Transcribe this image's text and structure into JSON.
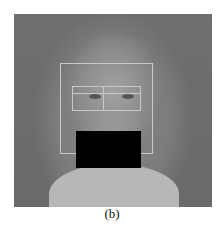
{
  "figure": {
    "caption": "(b)",
    "image_description": "grayscale face photo with detection boxes and occlusion bar",
    "colors": {
      "background": "#6f6f6f",
      "box_outline": "#c8c8c8",
      "occlusion": "#000000"
    }
  }
}
